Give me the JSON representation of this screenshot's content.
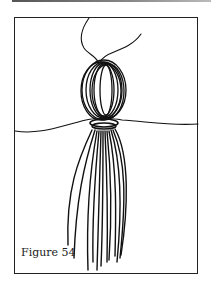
{
  "figure": {
    "caption": "Figure 54",
    "illustration": "tassel-illustration"
  }
}
